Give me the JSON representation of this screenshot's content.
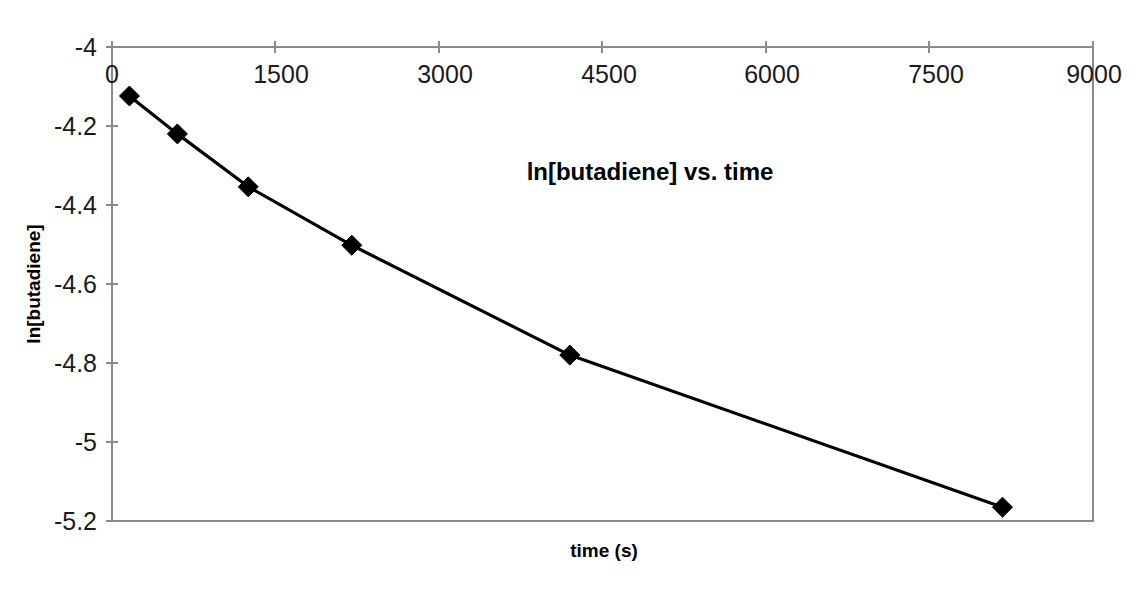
{
  "chart_data": {
    "type": "line",
    "title": "ln[butadiene] vs. time",
    "xlabel": "time (s)",
    "ylabel": "ln[butadiene]",
    "xlim": [
      0,
      9000
    ],
    "ylim": [
      -5.2,
      -4.0
    ],
    "xticks": [
      0,
      1500,
      3000,
      4500,
      6000,
      7500,
      9000
    ],
    "xtick_labels": [
      "0",
      "1500",
      "3000",
      "4500",
      "6000",
      "7500",
      "9000"
    ],
    "yticks": [
      -4.0,
      -4.2,
      -4.4,
      -4.6,
      -4.8,
      -5.0,
      -5.2
    ],
    "ytick_labels": [
      "-4",
      "-4.2",
      "-4.4",
      "-4.6",
      "-4.8",
      "-5",
      "-5.2"
    ],
    "grid": false,
    "legend": "none",
    "x_axis_position": "top",
    "marker": "diamond",
    "marker_color": "#000000",
    "line_color": "#000000",
    "series": [
      {
        "name": "ln[butadiene]",
        "x": [
          160,
          600,
          1250,
          2200,
          4200,
          8170
        ],
        "values": [
          -4.124,
          -4.22,
          -4.354,
          -4.502,
          -4.78,
          -5.165
        ]
      }
    ]
  },
  "axis_style": {
    "border_color": "#8a8a8a",
    "text_color": "#1a1a1a"
  }
}
